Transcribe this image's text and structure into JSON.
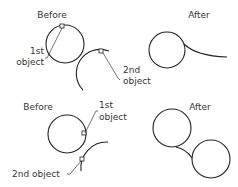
{
  "diagram": {
    "type": "fillet-illustration",
    "panels": [
      {
        "id": "top-before",
        "title": "Before",
        "labels": {
          "first_line1": "1st",
          "first_line2": "object",
          "second_line1": "2nd",
          "second_line2": "object"
        }
      },
      {
        "id": "top-after",
        "title": "After"
      },
      {
        "id": "bottom-before",
        "title": "Before",
        "labels": {
          "first_line1": "1st",
          "first_line2": "object",
          "second": "2nd  object"
        }
      },
      {
        "id": "bottom-after",
        "title": "After"
      }
    ],
    "colors": {
      "line": "#222222",
      "text": "#333333",
      "background": "#ffffff"
    }
  }
}
